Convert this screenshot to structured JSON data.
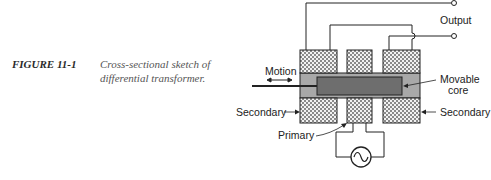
{
  "figure": {
    "label": "FIGURE 11-1",
    "caption_line1": "Cross-sectional sketch of",
    "caption_line2": "differential transformer."
  },
  "diagram": {
    "labels": {
      "output": "Output",
      "motion": "Motion",
      "movable_core_line1": "Movable",
      "movable_core_line2": "core",
      "secondary_left": "Secondary",
      "secondary_right": "Secondary",
      "primary": "Primary"
    },
    "components": [
      "left secondary coil",
      "primary coil",
      "right secondary coil",
      "movable core",
      "AC source",
      "output terminals"
    ],
    "colors": {
      "line": "#222222",
      "sleeve": "#a8a8a8",
      "core": "#6e6e6e",
      "coil_fill": "#e8e8e8"
    }
  }
}
